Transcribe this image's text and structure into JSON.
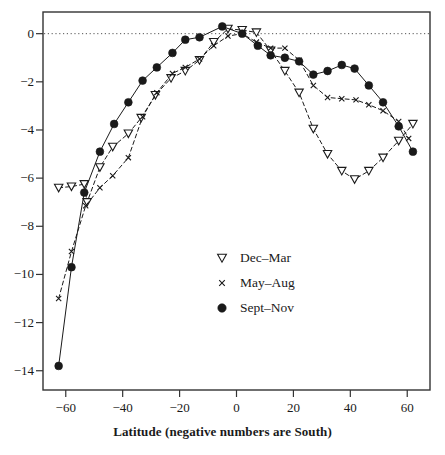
{
  "chart_data": {
    "type": "line",
    "title": "",
    "xlabel": "Latitude (negative numbers are South)",
    "ylabel": "",
    "xlim": [
      -68,
      68
    ],
    "ylim": [
      -14.8,
      0.9
    ],
    "xticks": [
      -60,
      -40,
      -20,
      0,
      20,
      40,
      60
    ],
    "xticklabels": [
      "−60",
      "−40",
      "−20",
      "0",
      "20",
      "40",
      "60"
    ],
    "yticks": [
      0,
      -2,
      -4,
      -6,
      -8,
      -10,
      -12,
      -14
    ],
    "yticklabels": [
      "0",
      "−2",
      "−4",
      "−6",
      "−8",
      "−10",
      "−12",
      "−14"
    ],
    "grid": false,
    "zero_reference_line": true,
    "legend_position": "center-right",
    "series": [
      {
        "name": "Dec–Mar",
        "marker": "triangle-down-open",
        "linestyle": "dashed",
        "color": "#1a1a1a",
        "points": [
          [
            -62.5,
            -6.4
          ],
          [
            -58.0,
            -6.35
          ],
          [
            -53.5,
            -6.25
          ],
          [
            -52.5,
            -7.0
          ],
          [
            -48.0,
            -5.55
          ],
          [
            -43.5,
            -4.7
          ],
          [
            -38.0,
            -4.15
          ],
          [
            -33.5,
            -3.5
          ],
          [
            -28.5,
            -2.55
          ],
          [
            -23.0,
            -1.85
          ],
          [
            -18.0,
            -1.55
          ],
          [
            -13.0,
            -1.1
          ],
          [
            -8.0,
            -0.35
          ],
          [
            -3.0,
            0.2
          ],
          [
            2.0,
            0.15
          ],
          [
            7.0,
            0.05
          ],
          [
            12.0,
            -0.7
          ],
          [
            17.0,
            -1.55
          ],
          [
            22.0,
            -2.45
          ],
          [
            27.0,
            -3.95
          ],
          [
            32.0,
            -5.0
          ],
          [
            37.0,
            -5.7
          ],
          [
            41.5,
            -6.05
          ],
          [
            46.5,
            -5.7
          ],
          [
            51.5,
            -5.15
          ],
          [
            57.0,
            -4.45
          ],
          [
            62.0,
            -3.75
          ]
        ]
      },
      {
        "name": "May–Aug",
        "marker": "x",
        "linestyle": "dashed",
        "color": "#1a1a1a",
        "points": [
          [
            -62.5,
            -11.0
          ],
          [
            -58.0,
            -9.05
          ],
          [
            -53.0,
            -7.15
          ],
          [
            -48.0,
            -6.4
          ],
          [
            -43.5,
            -5.9
          ],
          [
            -38.0,
            -5.15
          ],
          [
            -33.0,
            -3.45
          ],
          [
            -28.0,
            -2.45
          ],
          [
            -22.5,
            -1.65
          ],
          [
            -18.0,
            -1.4
          ],
          [
            -13.0,
            -1.05
          ],
          [
            -8.0,
            -0.5
          ],
          [
            -3.0,
            -0.1
          ],
          [
            2.0,
            0.0
          ],
          [
            7.0,
            -0.35
          ],
          [
            12.0,
            -0.6
          ],
          [
            17.0,
            -0.6
          ],
          [
            22.0,
            -1.1
          ],
          [
            27.0,
            -2.15
          ],
          [
            32.0,
            -2.65
          ],
          [
            37.0,
            -2.7
          ],
          [
            42.0,
            -2.75
          ],
          [
            46.5,
            -2.95
          ],
          [
            51.5,
            -3.2
          ],
          [
            57.0,
            -3.65
          ],
          [
            60.5,
            -4.35
          ]
        ]
      },
      {
        "name": "Sept–Nov",
        "marker": "circle-filled",
        "linestyle": "solid",
        "color": "#1a1a1a",
        "points": [
          [
            -62.5,
            -13.8
          ],
          [
            -58.0,
            -9.7
          ],
          [
            -53.5,
            -6.6
          ],
          [
            -48.0,
            -4.9
          ],
          [
            -43.0,
            -3.75
          ],
          [
            -38.0,
            -2.85
          ],
          [
            -33.0,
            -1.95
          ],
          [
            -28.0,
            -1.4
          ],
          [
            -22.5,
            -0.8
          ],
          [
            -18.0,
            -0.25
          ],
          [
            -13.0,
            -0.15
          ],
          [
            -5.0,
            0.3
          ],
          [
            2.0,
            0.0
          ],
          [
            7.5,
            -0.5
          ],
          [
            12.0,
            -0.9
          ],
          [
            17.0,
            -1.0
          ],
          [
            22.0,
            -1.15
          ],
          [
            27.0,
            -1.7
          ],
          [
            32.0,
            -1.55
          ],
          [
            37.0,
            -1.3
          ],
          [
            41.5,
            -1.45
          ],
          [
            46.5,
            -2.15
          ],
          [
            51.5,
            -2.85
          ],
          [
            57.0,
            -3.85
          ],
          [
            62.0,
            -4.9
          ]
        ]
      }
    ]
  },
  "legend": {
    "entries": [
      {
        "label": "Dec–Mar",
        "marker": "triangle-down-open"
      },
      {
        "label": "May–Aug",
        "marker": "x"
      },
      {
        "label": "Sept–Nov",
        "marker": "circle-filled"
      }
    ]
  },
  "colors": {
    "ink": "#1a1a1a",
    "axis": "#333333",
    "reference_line": "#555555",
    "background": "#ffffff"
  }
}
